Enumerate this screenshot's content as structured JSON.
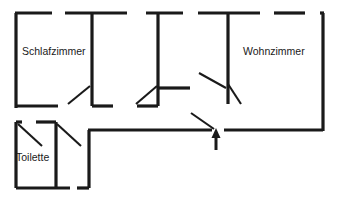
{
  "document": {
    "type": "floor-plan",
    "title": "Grundriss",
    "language": "de",
    "background_color": "#ffffff",
    "line_color": "#1a1a1a",
    "canvas": {
      "width": 345,
      "height": 199
    }
  },
  "rooms": [
    {
      "id": "schlafzimmer",
      "label": "Schlafzimmer",
      "label_x": 22,
      "label_y": 52,
      "anchor": "start"
    },
    {
      "id": "wohnzimmer",
      "label": "Wohnzimmer",
      "label_x": 243,
      "label_y": 52,
      "anchor": "start"
    },
    {
      "id": "toilette",
      "label": "Toilette",
      "label_x": 16,
      "label_y": 158,
      "anchor": "start"
    }
  ],
  "walls": [
    {
      "id": "outer-top-left-seg",
      "x1": 15,
      "y1": 13,
      "x2": 52,
      "y2": 13
    },
    {
      "id": "outer-top-seg-2",
      "x1": 65,
      "y1": 13,
      "x2": 127,
      "y2": 13
    },
    {
      "id": "outer-top-seg-3",
      "x1": 146,
      "y1": 13,
      "x2": 183,
      "y2": 13
    },
    {
      "id": "outer-top-seg-4",
      "x1": 198,
      "y1": 13,
      "x2": 260,
      "y2": 13
    },
    {
      "id": "outer-top-seg-5",
      "x1": 274,
      "y1": 13,
      "x2": 305,
      "y2": 13
    },
    {
      "id": "outer-top-seg-6",
      "x1": 320,
      "y1": 13,
      "x2": 324,
      "y2": 13
    },
    {
      "id": "outer-left-upper",
      "x1": 16,
      "y1": 13,
      "x2": 16,
      "y2": 108
    },
    {
      "id": "room1-bottom",
      "x1": 16,
      "y1": 106,
      "x2": 58,
      "y2": 106
    },
    {
      "id": "partition-1-vertical",
      "x1": 92,
      "y1": 13,
      "x2": 92,
      "y2": 106
    },
    {
      "id": "room2-bottom-right-stub",
      "x1": 92,
      "y1": 106,
      "x2": 113,
      "y2": 106
    },
    {
      "id": "partition-2-vertical",
      "x1": 158,
      "y1": 13,
      "x2": 158,
      "y2": 106
    },
    {
      "id": "room3-bottom-left-stub",
      "x1": 137,
      "y1": 106,
      "x2": 158,
      "y2": 106
    },
    {
      "id": "partition-2-stub-right",
      "x1": 158,
      "y1": 88,
      "x2": 190,
      "y2": 88
    },
    {
      "id": "partition-3-vertical",
      "x1": 228,
      "y1": 13,
      "x2": 228,
      "y2": 104
    },
    {
      "id": "outer-right-vertical",
      "x1": 323,
      "y1": 13,
      "x2": 323,
      "y2": 131
    },
    {
      "id": "corridor-bottom-right",
      "x1": 224,
      "y1": 130,
      "x2": 323,
      "y2": 130
    },
    {
      "id": "corridor-bottom-left",
      "x1": 88,
      "y1": 130,
      "x2": 212,
      "y2": 130
    },
    {
      "id": "corridor-left-vertical",
      "x1": 89,
      "y1": 130,
      "x2": 89,
      "y2": 188
    },
    {
      "id": "corridor-foot-stub",
      "x1": 77,
      "y1": 188,
      "x2": 89,
      "y2": 188
    },
    {
      "id": "lower-left-outer-left",
      "x1": 16,
      "y1": 122,
      "x2": 16,
      "y2": 188
    },
    {
      "id": "lower-left-top-seg-1",
      "x1": 16,
      "y1": 122,
      "x2": 22,
      "y2": 122
    },
    {
      "id": "lower-left-top-seg-2",
      "x1": 36,
      "y1": 122,
      "x2": 56,
      "y2": 122
    },
    {
      "id": "toilette-partition",
      "x1": 56,
      "y1": 122,
      "x2": 56,
      "y2": 188
    },
    {
      "id": "lower-bottom-wall",
      "x1": 16,
      "y1": 188,
      "x2": 70,
      "y2": 188
    }
  ],
  "door_leaves": [
    {
      "id": "door-schlafzimmer",
      "x1": 68,
      "y1": 104,
      "x2": 90,
      "y2": 86
    },
    {
      "id": "door-room3",
      "x1": 136,
      "y1": 104,
      "x2": 157,
      "y2": 86
    },
    {
      "id": "door-wohnzimmer-a",
      "x1": 199,
      "y1": 73,
      "x2": 226,
      "y2": 88
    },
    {
      "id": "door-wohnzimmer-b",
      "x1": 228,
      "y1": 84,
      "x2": 241,
      "y2": 104
    },
    {
      "id": "door-entry",
      "x1": 191,
      "y1": 113,
      "x2": 214,
      "y2": 129
    },
    {
      "id": "door-toilette-left",
      "x1": 18,
      "y1": 124,
      "x2": 42,
      "y2": 146
    },
    {
      "id": "door-toilette-right",
      "x1": 57,
      "y1": 124,
      "x2": 81,
      "y2": 146
    }
  ],
  "entry_arrow": {
    "id": "entrance-arrow",
    "direction": "up",
    "x": 216,
    "tip_y": 128,
    "tail_y": 150,
    "head_width": 9,
    "head_height": 10
  }
}
